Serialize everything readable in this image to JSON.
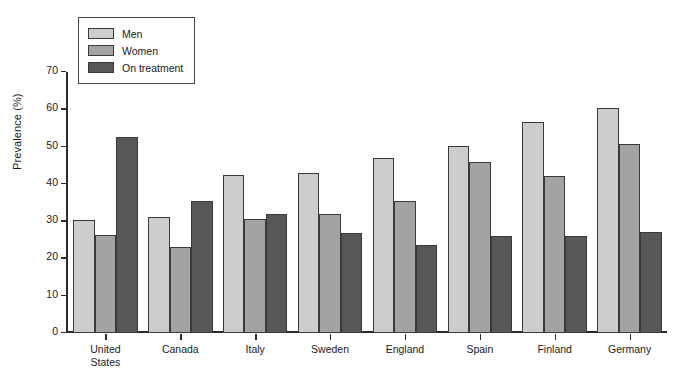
{
  "chart_data": {
    "type": "bar",
    "title": "",
    "xlabel": "",
    "ylabel": "Prevalence (%)",
    "ylim": [
      0,
      70
    ],
    "yticks": [
      0,
      10,
      20,
      30,
      40,
      50,
      60,
      70
    ],
    "ytick_labels": [
      "0",
      "10",
      "20",
      "30",
      "40",
      "50",
      "60",
      "70"
    ],
    "grid": false,
    "legend_position": "top-left",
    "categories": [
      "United\nStates",
      "Canada",
      "Italy",
      "Sweden",
      "England",
      "Spain",
      "Finland",
      "Germany"
    ],
    "series": [
      {
        "name": "Men",
        "color": "#cdcdcd",
        "values": [
          30.3,
          31.2,
          42.5,
          42.8,
          47.0,
          50.2,
          56.5,
          60.3
        ]
      },
      {
        "name": "Women",
        "color": "#a3a3a3",
        "values": [
          26.2,
          23.0,
          30.7,
          31.8,
          35.3,
          45.8,
          42.1,
          50.7
        ]
      },
      {
        "name": "On treatment",
        "color": "#575757",
        "values": [
          52.5,
          35.3,
          31.9,
          26.7,
          23.6,
          25.9,
          25.9,
          27.0
        ]
      }
    ]
  },
  "legend": {
    "items": [
      {
        "label": "Men"
      },
      {
        "label": "Women"
      },
      {
        "label": "On treatment"
      }
    ]
  },
  "footnote": {
    "text": ""
  }
}
